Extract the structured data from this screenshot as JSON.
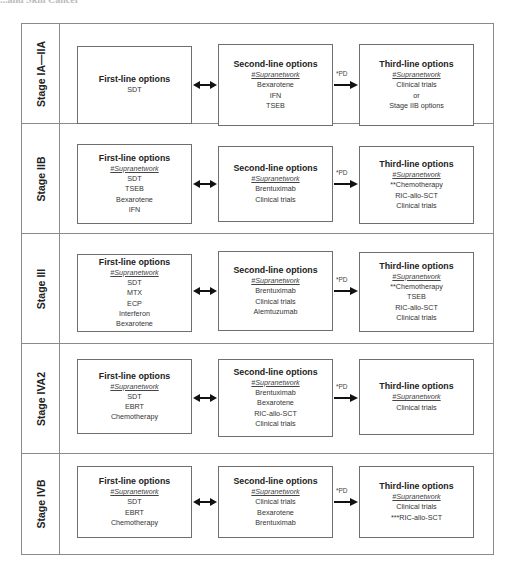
{
  "header": {
    "cut_title": "...and Skin Cancer"
  },
  "icons": {
    "double_arrow": "double-headed-arrow",
    "progression_arrow": "right-arrow"
  },
  "colors": {
    "border": "#8a8a8a",
    "box_border": "#6f6f6f",
    "text": "#222222",
    "background": "#ffffff"
  },
  "stages": [
    {
      "label": "Stage IA—IIA",
      "first": {
        "title": "First-line options",
        "network": "",
        "items": [
          "SDT"
        ]
      },
      "second": {
        "title": "Second-line options",
        "network": "#Supranetwork",
        "items": [
          "Bexarotene",
          "IFN",
          "TSEB"
        ]
      },
      "pd_label": "*PD",
      "third": {
        "title": "Third-line options",
        "network": "#Supranetwork",
        "items": [
          "Clinical trials",
          "or",
          "Stage IIB options"
        ]
      }
    },
    {
      "label": "Stage IIB",
      "first": {
        "title": "First-line options",
        "network": "#Supranetwork",
        "items": [
          "SDT",
          "TSEB",
          "Bexarotene",
          "IFN"
        ]
      },
      "second": {
        "title": "Second-line options",
        "network": "#Supranetwork",
        "items": [
          "Brentuximab",
          "Clinical trials"
        ]
      },
      "pd_label": "*PD",
      "third": {
        "title": "Third-line options",
        "network": "#Supranetwork",
        "items": [
          "**Chemotherapy",
          "RIC-allo-SCT",
          "Clinical trials"
        ]
      }
    },
    {
      "label": "Stage III",
      "first": {
        "title": "First-line options",
        "network": "#Supranetwork",
        "items": [
          "SDT",
          "MTX",
          "ECP",
          "Interferon",
          "Bexarotene"
        ]
      },
      "second": {
        "title": "Second-line options",
        "network": "#Supranetwork",
        "items": [
          "Brentuximab",
          "Clinical trials",
          "Alemtuzumab"
        ]
      },
      "pd_label": "*PD",
      "third": {
        "title": "Third-line options",
        "network": "#Supranetwork",
        "items": [
          "**Chemotherapy",
          "TSEB",
          "RIC-allo-SCT",
          "Clinical trials"
        ]
      }
    },
    {
      "label": "Stage IVA2",
      "first": {
        "title": "First-line options",
        "network": "#Supranetwork",
        "items": [
          "SDT",
          "EBRT",
          "Chemotherapy"
        ]
      },
      "second": {
        "title": "Second-line options",
        "network": "#Supranetwork",
        "items": [
          "Brentuximab",
          "Bexarotene",
          "RIC-allo-SCT",
          "Clinical trials"
        ]
      },
      "pd_label": "*PD",
      "third": {
        "title": "Third-line options",
        "network": "#Supranetwork",
        "items": [
          "Clinical trials"
        ]
      }
    },
    {
      "label": "Stage IVB",
      "first": {
        "title": "First-line options",
        "network": "#Supranetwork",
        "items": [
          "SDT",
          "EBRT",
          "Chemotherapy"
        ]
      },
      "second": {
        "title": "Second-line options",
        "network": "#Supranetwork",
        "items": [
          "Clinical trials",
          "Bexarotene",
          "Brentuximab"
        ]
      },
      "pd_label": "*PD",
      "third": {
        "title": "Third-line options",
        "network": "#Supranetwork",
        "items": [
          "Clinical trials",
          "***RIC-allo-SCT"
        ]
      }
    }
  ]
}
